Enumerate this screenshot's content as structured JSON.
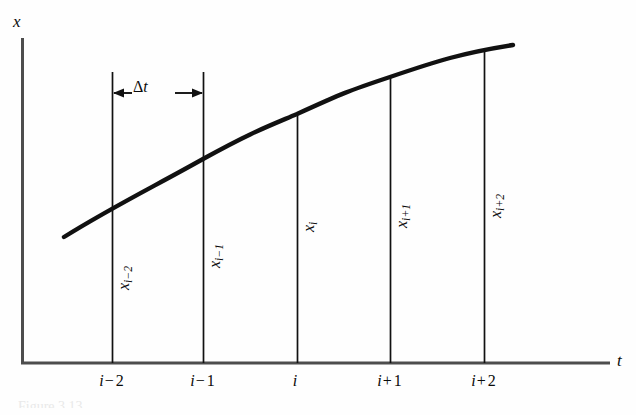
{
  "figure": {
    "background_color": "#fefefe",
    "ink_color": "#111111",
    "axis_color": "#555555",
    "width": 636,
    "height": 415
  },
  "axes": {
    "vertical_label": "x",
    "horizontal_label": "t",
    "origin_x": 22,
    "baseline_y": 363,
    "vertical_top_y": 38,
    "horizontal_right_x": 610
  },
  "annotation": {
    "delta_symbol": "Δ",
    "delta_variable": "t",
    "delta_full": "Δ t",
    "bracket_y": 93,
    "bracket_from_x": 112,
    "bracket_to_x": 203
  },
  "ordinate_labels": [
    {
      "text": "x",
      "sub": "i−2",
      "x": 116,
      "y": 290
    },
    {
      "text": "x",
      "sub": "i−1",
      "x": 207,
      "y": 268
    },
    {
      "text": "x",
      "sub": "i",
      "x": 301,
      "y": 232
    },
    {
      "text": "x",
      "sub": "i+1",
      "x": 394,
      "y": 228
    },
    {
      "text": "x",
      "sub": "i+2",
      "x": 488,
      "y": 218
    }
  ],
  "tick_labels": [
    {
      "base": "i",
      "op": "−",
      "num": "2",
      "x": 112,
      "y": 373
    },
    {
      "base": "i",
      "op": "−",
      "num": "1",
      "x": 203,
      "y": 373
    },
    {
      "base": "i",
      "op": "",
      "num": "",
      "x": 297,
      "y": 373
    },
    {
      "base": "i",
      "op": "+",
      "num": "1",
      "x": 390,
      "y": 373
    },
    {
      "base": "i",
      "op": "+",
      "num": "2",
      "x": 484,
      "y": 373
    }
  ],
  "chart_data": {
    "type": "line",
    "title": "",
    "xlabel": "t",
    "ylabel": "x",
    "grid": false,
    "legend": null,
    "xlim": [
      22,
      610
    ],
    "ylim": [
      363,
      38
    ],
    "note": "Concave-down sampled trajectory x(t) with five equally spaced grid stations spaced by the time step delta-t.",
    "categories": [
      "i−2",
      "i−1",
      "i",
      "i+1",
      "i+2"
    ],
    "grid_line_x_px": [
      112,
      203,
      297,
      390,
      484
    ],
    "curve_value_y_px": [
      207,
      159,
      115,
      78,
      52
    ],
    "grid_line_top_y_px": [
      72,
      72,
      115,
      78,
      52
    ],
    "curve_path_points": [
      {
        "x": 64,
        "y": 237
      },
      {
        "x": 112,
        "y": 207
      },
      {
        "x": 160,
        "y": 182
      },
      {
        "x": 203,
        "y": 159
      },
      {
        "x": 250,
        "y": 136
      },
      {
        "x": 297,
        "y": 115
      },
      {
        "x": 343,
        "y": 95
      },
      {
        "x": 390,
        "y": 78
      },
      {
        "x": 437,
        "y": 63
      },
      {
        "x": 484,
        "y": 52
      },
      {
        "x": 513,
        "y": 45
      }
    ],
    "series": [
      {
        "name": "x(t)",
        "values_px_y": [
          207,
          159,
          115,
          78,
          52
        ],
        "stroke_width": 4.2
      }
    ]
  },
  "ghosting": {
    "header_artifact": "          ",
    "caption_artifact": "Figure  3.13"
  }
}
